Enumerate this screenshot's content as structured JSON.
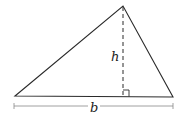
{
  "diagram": {
    "type": "triangle-area",
    "labels": {
      "height": "h",
      "base": "b"
    },
    "colors": {
      "stroke": "#2a2a2a",
      "dimension": "#888888",
      "background": "#ffffff"
    }
  }
}
